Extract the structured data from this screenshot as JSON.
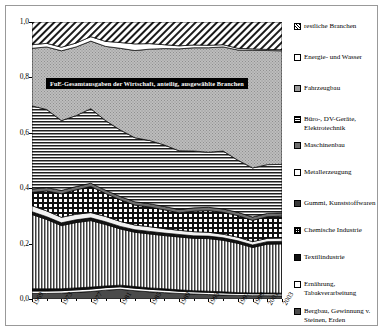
{
  "chart_data": {
    "type": "area",
    "title": "FuE-Gesamtausgaben der Wirtschaft, anteilig, ausgewählte Branchen",
    "xlabel": "",
    "ylabel": "",
    "ylim": [
      0.0,
      1.0
    ],
    "yticks": [
      "0,0",
      "0,2",
      "0,4",
      "0,6",
      "0,8",
      "1,0"
    ],
    "ytick_values": [
      0.0,
      0.2,
      0.4,
      0.6,
      0.8,
      1.0
    ],
    "grid": false,
    "legend_position": "right",
    "stacked": true,
    "normalized": true,
    "x": [
      1969,
      1971,
      1973,
      1975,
      1977,
      1979,
      1981,
      1983,
      1985,
      1987,
      1989,
      1991,
      1993,
      1995,
      1997,
      1999,
      2001,
      2003
    ],
    "xtick_labels": [
      "1969",
      "1973",
      "1977",
      "1981",
      "1985",
      "1989",
      "1993",
      "1997",
      "1999",
      "2001",
      "2003"
    ],
    "xtick_values": [
      1969,
      1973,
      1977,
      1981,
      1985,
      1989,
      1993,
      1997,
      1999,
      2001,
      2003
    ],
    "series": [
      {
        "name": "Bergbau, Gewinnung v. Steinen, Erden",
        "pattern": "dark-gray-solid",
        "values": [
          0.02,
          0.02,
          0.021,
          0.024,
          0.027,
          0.032,
          0.035,
          0.03,
          0.026,
          0.023,
          0.02,
          0.018,
          0.016,
          0.014,
          0.013,
          0.012,
          0.012,
          0.011
        ]
      },
      {
        "name": "Ernährung, Tabakverarbeitung",
        "pattern": "white",
        "values": [
          0.009,
          0.009,
          0.009,
          0.009,
          0.009,
          0.009,
          0.009,
          0.009,
          0.009,
          0.009,
          0.008,
          0.008,
          0.008,
          0.008,
          0.007,
          0.007,
          0.007,
          0.007
        ]
      },
      {
        "name": "Textilindustrie",
        "pattern": "black",
        "values": [
          0.008,
          0.008,
          0.007,
          0.007,
          0.007,
          0.006,
          0.006,
          0.006,
          0.005,
          0.005,
          0.005,
          0.004,
          0.004,
          0.004,
          0.003,
          0.003,
          0.003,
          0.003
        ]
      },
      {
        "name": "Chemische Industrie",
        "pattern": "vertical-lines",
        "values": [
          0.268,
          0.25,
          0.228,
          0.236,
          0.24,
          0.222,
          0.203,
          0.196,
          0.195,
          0.192,
          0.191,
          0.189,
          0.19,
          0.186,
          0.178,
          0.164,
          0.176,
          0.178
        ]
      },
      {
        "name": "Textilindustrie-band",
        "pattern": "black-thin",
        "values": [
          0.01,
          0.01,
          0.01,
          0.01,
          0.01,
          0.01,
          0.009,
          0.009,
          0.009,
          0.009,
          0.009,
          0.009,
          0.009,
          0.009,
          0.009,
          0.009,
          0.009,
          0.009
        ]
      },
      {
        "name": "Metallerzeugung",
        "pattern": "white-light",
        "values": [
          0.022,
          0.021,
          0.02,
          0.02,
          0.019,
          0.019,
          0.018,
          0.017,
          0.017,
          0.016,
          0.015,
          0.015,
          0.014,
          0.013,
          0.013,
          0.012,
          0.012,
          0.012
        ]
      },
      {
        "name": "Gummi, Kunststoffwaren",
        "pattern": "checkerboard",
        "values": [
          0.048,
          0.072,
          0.085,
          0.088,
          0.094,
          0.083,
          0.078,
          0.072,
          0.071,
          0.068,
          0.063,
          0.074,
          0.078,
          0.079,
          0.078,
          0.077,
          0.078,
          0.079
        ]
      },
      {
        "name": "Maschinenbau",
        "pattern": "mid-gray",
        "values": [
          0.012,
          0.012,
          0.012,
          0.012,
          0.012,
          0.012,
          0.012,
          0.012,
          0.012,
          0.012,
          0.012,
          0.012,
          0.012,
          0.012,
          0.012,
          0.012,
          0.012,
          0.012
        ]
      },
      {
        "name": "Büro-, DV-Geräte, Elektrotechnik",
        "pattern": "horizontal-lines",
        "values": [
          0.3,
          0.282,
          0.252,
          0.256,
          0.269,
          0.251,
          0.24,
          0.231,
          0.228,
          0.222,
          0.212,
          0.205,
          0.199,
          0.209,
          0.188,
          0.177,
          0.176,
          0.175
        ]
      },
      {
        "name": "Fahrzeugbau",
        "pattern": "light-gray",
        "values": [
          0.208,
          0.226,
          0.252,
          0.248,
          0.244,
          0.268,
          0.295,
          0.315,
          0.33,
          0.348,
          0.368,
          0.373,
          0.377,
          0.376,
          0.398,
          0.425,
          0.412,
          0.41
        ]
      },
      {
        "name": "Energie- und Wasser",
        "pattern": "white-band",
        "values": [
          0.013,
          0.013,
          0.013,
          0.014,
          0.016,
          0.018,
          0.021,
          0.024,
          0.02,
          0.014,
          0.011,
          0.01,
          0.009,
          0.008,
          0.006,
          0.005,
          0.004,
          0.004
        ]
      },
      {
        "name": "restliche Branchen",
        "pattern": "diagonal-hatch",
        "values": [
          0.082,
          0.077,
          0.091,
          0.076,
          0.053,
          0.07,
          0.074,
          0.079,
          0.078,
          0.082,
          0.086,
          0.083,
          0.084,
          0.082,
          0.095,
          0.097,
          0.099,
          0.1
        ]
      }
    ],
    "legend": [
      {
        "label": "restliche Branchen",
        "pattern": "diagonal-hatch"
      },
      {
        "label": "Energie- und Wasser",
        "pattern": "white"
      },
      {
        "label": "Fahrzeugbau",
        "pattern": "light-gray"
      },
      {
        "label": "Büro-, DV-Geräte, Elektrotechnik",
        "pattern": "horizontal-lines"
      },
      {
        "label": "Maschinenbau",
        "pattern": "mid-gray"
      },
      {
        "label": "Metallerzeugung",
        "pattern": "white"
      },
      {
        "label": "Gummi, Kunststoffwaren",
        "pattern": "dark"
      },
      {
        "label": "Chemische Industrie",
        "pattern": "checkerboard"
      },
      {
        "label": "Textilindustrie",
        "pattern": "black"
      },
      {
        "label": "Ernährung, Tabakverarbeitung",
        "pattern": "white"
      },
      {
        "label": "Bergbau, Gewinnung v. Steinen, Erden",
        "pattern": "dark-gray"
      }
    ]
  }
}
